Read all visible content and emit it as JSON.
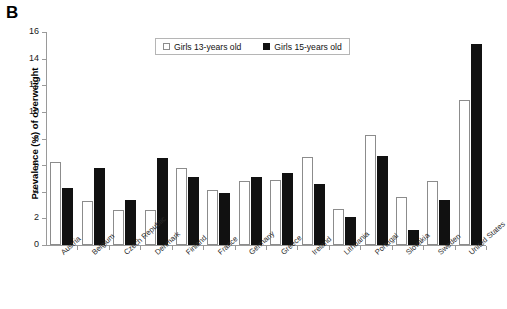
{
  "panel": {
    "letter": "B"
  },
  "legend": {
    "entries": [
      {
        "label": "Girls 13-years old",
        "style": "light",
        "color": "#ffffff"
      },
      {
        "label": "Girls 15-years old",
        "style": "dark",
        "color": "#111111"
      }
    ]
  },
  "axes": {
    "y_title": "Prevalence (%) of overweight",
    "y_ticks": [
      "0",
      "2",
      "4",
      "6",
      "8",
      "10",
      "12",
      "14",
      "16"
    ]
  },
  "chart_data": {
    "type": "bar",
    "title": "",
    "xlabel": "",
    "ylabel": "Prevalence (%) of overweight",
    "ylim": [
      0,
      16
    ],
    "ytick_step": 2,
    "grid": false,
    "legend_position": "top-center",
    "categories": [
      "Austria",
      "Belgium",
      "Czech Republic",
      "Denmark",
      "Finland",
      "France",
      "Germany",
      "Greece",
      "Ireland",
      "Lithuania",
      "Portugal",
      "Slovakia",
      "Sweden",
      "United States"
    ],
    "series": [
      {
        "name": "Girls 13-years old",
        "color": "#ffffff",
        "values": [
          6.2,
          3.3,
          2.6,
          2.6,
          5.8,
          4.1,
          4.8,
          4.9,
          6.6,
          2.7,
          8.3,
          3.6,
          4.8,
          10.9
        ]
      },
      {
        "name": "Girls 15-years old",
        "color": "#111111",
        "values": [
          4.3,
          5.8,
          3.4,
          6.5,
          5.1,
          3.9,
          5.1,
          5.4,
          4.6,
          2.1,
          6.7,
          1.1,
          3.4,
          15.1
        ]
      }
    ]
  }
}
